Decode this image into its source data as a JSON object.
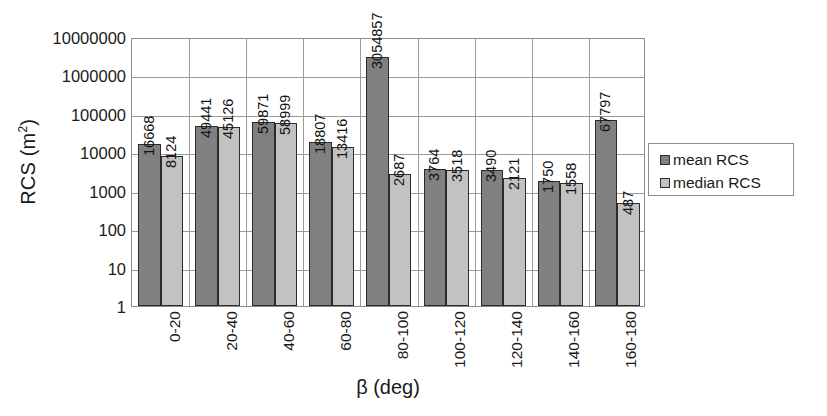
{
  "chart_data": {
    "type": "bar",
    "title": "",
    "xlabel": "β (deg)",
    "ylabel": "RCS (m²)",
    "ylabel_base": "RCS (m",
    "ylabel_sup": "2",
    "ylabel_close": ")",
    "yscale": "log",
    "ylim": [
      1,
      10000000
    ],
    "ytick_labels": [
      "10000000",
      "1000000",
      "100000",
      "10000",
      "1000",
      "100",
      "10",
      "1"
    ],
    "ytick_values": [
      10000000,
      1000000,
      100000,
      10000,
      1000,
      100,
      10,
      1
    ],
    "grid": "horizontal-and-vertical",
    "legend_position": "right",
    "categories": [
      "0-20",
      "20-40",
      "40-60",
      "60-80",
      "80-100",
      "100-120",
      "120-140",
      "140-160",
      "160-180"
    ],
    "series": [
      {
        "name": "mean RCS",
        "color": "#808080",
        "values": [
          16668,
          49441,
          59871,
          18807,
          3054857,
          3764,
          3490,
          1750,
          67797
        ],
        "labels": [
          "16668",
          "49441",
          "59871",
          "18807",
          "3054857",
          "3764",
          "3490",
          "1750",
          "67797"
        ]
      },
      {
        "name": "median RCS",
        "color": "#c2c2c2",
        "values": [
          8124,
          45126,
          58999,
          13416,
          2687,
          3518,
          2121,
          1558,
          487
        ],
        "labels": [
          "8124",
          "45126",
          "58999",
          "13416",
          "2687",
          "3518",
          "2121",
          "1558",
          "487"
        ]
      }
    ]
  },
  "legend": {
    "entries": [
      {
        "label": "mean RCS",
        "swatch": "mean"
      },
      {
        "label": "median RCS",
        "swatch": "median"
      }
    ]
  },
  "colors": {
    "mean_bar": "#808080",
    "median_bar": "#c2c2c2",
    "bar_outline": "#2b2b2b",
    "gridline": "#9a9a9a",
    "plot_border": "#8c8c8c",
    "text": "#1a1a1a",
    "background": "#ffffff"
  }
}
